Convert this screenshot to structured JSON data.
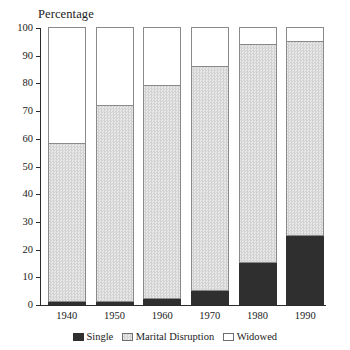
{
  "chart_data": {
    "type": "bar",
    "title": "",
    "xlabel": "",
    "ylabel": "Percentage",
    "ylim": [
      0,
      100
    ],
    "ytick_step": 10,
    "yticks": [
      100,
      90,
      80,
      70,
      60,
      50,
      40,
      30,
      20,
      10,
      0
    ],
    "grid": false,
    "stacked": true,
    "legend_position": "bottom-center",
    "categories": [
      "1940",
      "1950",
      "1960",
      "1970",
      "1980",
      "1990"
    ],
    "series": [
      {
        "name": "Single",
        "color": "#2f2f2f",
        "values": [
          1,
          1,
          2,
          5,
          15,
          25
        ]
      },
      {
        "name": "Marital Disruption",
        "color": "#dcdcdc",
        "values": [
          57,
          71,
          77,
          81,
          79,
          70
        ]
      },
      {
        "name": "Widowed",
        "color": "#ffffff",
        "values": [
          42,
          28,
          21,
          14,
          6,
          5
        ]
      }
    ],
    "cumulative_tops": {
      "single": [
        1,
        1,
        2,
        5,
        15,
        25
      ],
      "marital_disruption": [
        58,
        72,
        79,
        86,
        94,
        95
      ],
      "widowed": [
        100,
        100,
        100,
        100,
        100,
        100
      ]
    }
  },
  "legend": {
    "items": [
      {
        "label": "Single",
        "swatch": "swatch-single"
      },
      {
        "label": "Marital Disruption",
        "swatch": "swatch-disruption"
      },
      {
        "label": "Widowed",
        "swatch": "swatch-widowed"
      }
    ]
  }
}
